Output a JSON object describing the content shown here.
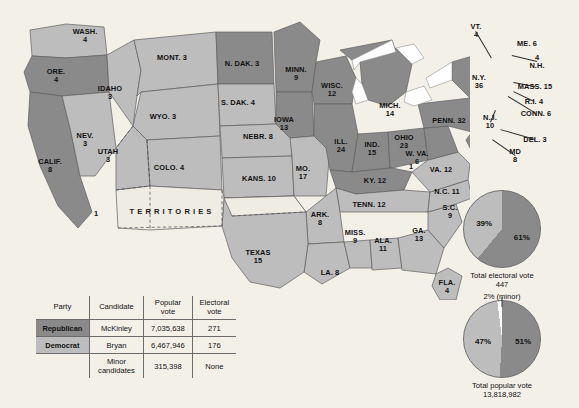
{
  "map": {
    "title": "Election of 1896 electoral map",
    "colors": {
      "republican": "#8a8a8a",
      "democrat": "#bdbdbd",
      "territory": "#efece4",
      "background": "#f3f0e8",
      "water": "#ffffff",
      "border": "#5e5e5e"
    },
    "territories_label": "TERRITORIES",
    "extra_markers": [
      {
        "name": "california-split-elector",
        "label": "1",
        "x": 96,
        "y": 213
      },
      {
        "name": "kentucky-split-elector",
        "label": "1",
        "x": 411,
        "y": 166
      }
    ],
    "states": [
      {
        "name": "washington",
        "label": "WASH.",
        "votes": "4",
        "party": "democrat",
        "x": 85,
        "y": 36,
        "lines": 2
      },
      {
        "name": "oregon",
        "label": "ORE.",
        "votes": "4",
        "party": "republican",
        "x": 56,
        "y": 76,
        "lines": 2
      },
      {
        "name": "california",
        "label": "CALIF.",
        "votes": "8",
        "party": "republican",
        "x": 50,
        "y": 166,
        "lines": 2
      },
      {
        "name": "nevada",
        "label": "NEV.",
        "votes": "3",
        "party": "democrat",
        "x": 85,
        "y": 140,
        "lines": 2
      },
      {
        "name": "idaho",
        "label": "IDAHO",
        "votes": "3",
        "party": "democrat",
        "x": 110,
        "y": 93,
        "lines": 2
      },
      {
        "name": "montana",
        "label": "MONT. 3",
        "votes": "",
        "party": "democrat",
        "x": 172,
        "y": 58,
        "lines": 1
      },
      {
        "name": "wyoming",
        "label": "WYO. 3",
        "votes": "",
        "party": "democrat",
        "x": 163,
        "y": 117,
        "lines": 1
      },
      {
        "name": "utah",
        "label": "UTAH",
        "votes": "3",
        "party": "democrat",
        "x": 108,
        "y": 156,
        "lines": 2
      },
      {
        "name": "colorado",
        "label": "COLO. 4",
        "votes": "",
        "party": "democrat",
        "x": 169,
        "y": 168,
        "lines": 1
      },
      {
        "name": "north-dakota",
        "label": "N. DAK. 3",
        "votes": "",
        "party": "republican",
        "x": 242,
        "y": 64,
        "lines": 1
      },
      {
        "name": "south-dakota",
        "label": "S. DAK. 4",
        "votes": "",
        "party": "democrat",
        "x": 238,
        "y": 103,
        "lines": 1
      },
      {
        "name": "nebraska",
        "label": "NEBR. 8",
        "votes": "",
        "party": "democrat",
        "x": 258,
        "y": 137,
        "lines": 1
      },
      {
        "name": "kansas",
        "label": "KANS. 10",
        "votes": "",
        "party": "democrat",
        "x": 259,
        "y": 179,
        "lines": 1
      },
      {
        "name": "minnesota",
        "label": "MINN.",
        "votes": "9",
        "party": "republican",
        "x": 296,
        "y": 74,
        "lines": 2
      },
      {
        "name": "iowa",
        "label": "IOWA",
        "votes": "13",
        "party": "republican",
        "x": 284,
        "y": 124,
        "lines": 2
      },
      {
        "name": "missouri",
        "label": "MO.",
        "votes": "17",
        "party": "democrat",
        "x": 303,
        "y": 173,
        "lines": 2
      },
      {
        "name": "wisconsin",
        "label": "WISC.",
        "votes": "12",
        "party": "republican",
        "x": 332,
        "y": 90,
        "lines": 2
      },
      {
        "name": "illinois",
        "label": "ILL.",
        "votes": "24",
        "party": "republican",
        "x": 341,
        "y": 146,
        "lines": 2
      },
      {
        "name": "michigan",
        "label": "MICH.",
        "votes": "14",
        "party": "republican",
        "x": 390,
        "y": 110,
        "lines": 2
      },
      {
        "name": "indiana",
        "label": "IND.",
        "votes": "15",
        "party": "republican",
        "x": 372,
        "y": 149,
        "lines": 2
      },
      {
        "name": "ohio",
        "label": "OHIO",
        "votes": "23",
        "party": "republican",
        "x": 404,
        "y": 142,
        "lines": 2
      },
      {
        "name": "kentucky",
        "label": "KY. 12",
        "votes": "",
        "party": "republican",
        "x": 375,
        "y": 181,
        "lines": 1
      },
      {
        "name": "tennessee",
        "label": "TENN. 12",
        "votes": "",
        "party": "democrat",
        "x": 369,
        "y": 205,
        "lines": 1
      },
      {
        "name": "arkansas",
        "label": "ARK.",
        "votes": "8",
        "party": "democrat",
        "x": 320,
        "y": 219,
        "lines": 2
      },
      {
        "name": "louisiana",
        "label": "LA. 8",
        "votes": "",
        "party": "democrat",
        "x": 330,
        "y": 273,
        "lines": 1
      },
      {
        "name": "mississippi",
        "label": "MISS.",
        "votes": "9",
        "party": "democrat",
        "x": 355,
        "y": 237,
        "lines": 2
      },
      {
        "name": "alabama",
        "label": "ALA.",
        "votes": "11",
        "party": "democrat",
        "x": 383,
        "y": 245,
        "lines": 2
      },
      {
        "name": "georgia",
        "label": "GA.",
        "votes": "13",
        "party": "democrat",
        "x": 419,
        "y": 235,
        "lines": 2
      },
      {
        "name": "florida",
        "label": "FLA.",
        "votes": "4",
        "party": "democrat",
        "x": 447,
        "y": 287,
        "lines": 2
      },
      {
        "name": "south-carolina",
        "label": "S.C.",
        "votes": "9",
        "party": "democrat",
        "x": 450,
        "y": 212,
        "lines": 2
      },
      {
        "name": "north-carolina",
        "label": "N.C. 11",
        "votes": "",
        "party": "democrat",
        "x": 447,
        "y": 192,
        "lines": 1
      },
      {
        "name": "texas",
        "label": "TEXAS",
        "votes": "15",
        "party": "democrat",
        "x": 258,
        "y": 257,
        "lines": 2
      },
      {
        "name": "virginia",
        "label": "VA. 12",
        "votes": "",
        "party": "democrat",
        "x": 441,
        "y": 170,
        "lines": 1
      },
      {
        "name": "west-virginia",
        "label": "W. VA.",
        "votes": "6",
        "party": "republican",
        "x": 417,
        "y": 158,
        "lines": 2
      },
      {
        "name": "pennsylvania",
        "label": "PENN. 32",
        "votes": "",
        "party": "republican",
        "x": 449,
        "y": 121,
        "lines": 1
      },
      {
        "name": "new-york",
        "label": "N.Y.",
        "votes": "36",
        "party": "republican",
        "x": 479,
        "y": 82,
        "lines": 2
      },
      {
        "name": "maine",
        "label": "ME. 6",
        "votes": "",
        "party": "republican",
        "x": 527,
        "y": 44,
        "lines": 1
      }
    ],
    "callouts": [
      {
        "name": "vermont",
        "label": "VT.",
        "votes": "4",
        "tx": 476,
        "ty": 31,
        "lx": 492,
        "ly": 58
      },
      {
        "name": "new-hampshire",
        "label": "N.H.",
        "votes": "4",
        "tx": 537,
        "ty": 62,
        "lx": 512,
        "ly": 56,
        "reverse": true
      },
      {
        "name": "massachusetts",
        "label": "MASS. 15",
        "votes": "",
        "tx": 535,
        "ty": 87,
        "lx": 513,
        "ly": 83
      },
      {
        "name": "rhode-island",
        "label": "R.I. 4",
        "votes": "",
        "tx": 534,
        "ty": 102,
        "lx": 513,
        "ly": 92
      },
      {
        "name": "connecticut",
        "label": "CONN. 6",
        "votes": "",
        "tx": 536,
        "ty": 114,
        "lx": 508,
        "ly": 97
      },
      {
        "name": "new-jersey",
        "label": "N.J.",
        "votes": "10",
        "tx": 490,
        "ty": 122,
        "lx": 495,
        "ly": 110
      },
      {
        "name": "delaware",
        "label": "DEL. 3",
        "votes": "",
        "tx": 535,
        "ty": 140,
        "lx": 500,
        "ly": 130
      },
      {
        "name": "maryland",
        "label": "MD",
        "votes": "8",
        "tx": 515,
        "ty": 156,
        "lx": 492,
        "ly": 140
      }
    ]
  },
  "table": {
    "headers": {
      "party": "Party",
      "candidate": "Candidate",
      "popular_vote": "Popular vote",
      "electoral_vote": "Electoral vote"
    },
    "rows": [
      {
        "party": "Republican",
        "candidate": "McKinley",
        "popular_vote": "7,035,638",
        "electoral_vote": "271"
      },
      {
        "party": "Democrat",
        "candidate": "Bryan",
        "popular_vote": "6,467,946",
        "electoral_vote": "176"
      },
      {
        "party": "",
        "candidate": "Minor candidates",
        "popular_vote": "315,398",
        "electoral_vote": "None"
      }
    ]
  },
  "chart_data": [
    {
      "type": "pie",
      "name": "electoral-vote-pie",
      "title": "Total electoral vote",
      "total": "447",
      "slices": [
        {
          "label": "61%",
          "value": 61,
          "party": "republican",
          "color": "#8a8a8a"
        },
        {
          "label": "39%",
          "value": 39,
          "party": "democrat",
          "color": "#bdbdbd"
        }
      ],
      "note": "2% (minor)"
    },
    {
      "type": "pie",
      "name": "popular-vote-pie",
      "title": "Total popular vote",
      "total": "13,818,982",
      "slices": [
        {
          "label": "51%",
          "value": 51,
          "party": "republican",
          "color": "#8a8a8a"
        },
        {
          "label": "47%",
          "value": 47,
          "party": "democrat",
          "color": "#bdbdbd"
        },
        {
          "label": "",
          "value": 2,
          "party": "minor",
          "color": "#ffffff"
        }
      ]
    }
  ]
}
